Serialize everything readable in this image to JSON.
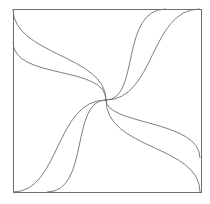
{
  "diagram": {
    "title": "",
    "colors": {
      "background": "#ffffff",
      "stroke": "#6e6e6e"
    },
    "square": {
      "x": 13,
      "y": 9,
      "width": 188,
      "height": 183
    },
    "center": {
      "x": 106,
      "y": 100
    },
    "curves": [
      {
        "id": "tl-1",
        "d": "M13,9 C13,55 106,55 106,100"
      },
      {
        "id": "tl-2",
        "d": "M13,42 C13,80 106,65 106,100"
      },
      {
        "id": "tr-1",
        "d": "M106,100 C155,100 150,9 200,9"
      },
      {
        "id": "tr-2",
        "d": "M106,100 C140,100 120,9 166,9"
      },
      {
        "id": "br-1",
        "d": "M106,100 C106,150 200,145 200,192"
      },
      {
        "id": "br-2",
        "d": "M106,100 C106,125 200,120 200,158"
      },
      {
        "id": "bl-1",
        "d": "M13,192 C60,192 55,100 106,100"
      },
      {
        "id": "bl-2",
        "d": "M47,192 C90,192 70,100 106,100"
      }
    ]
  }
}
